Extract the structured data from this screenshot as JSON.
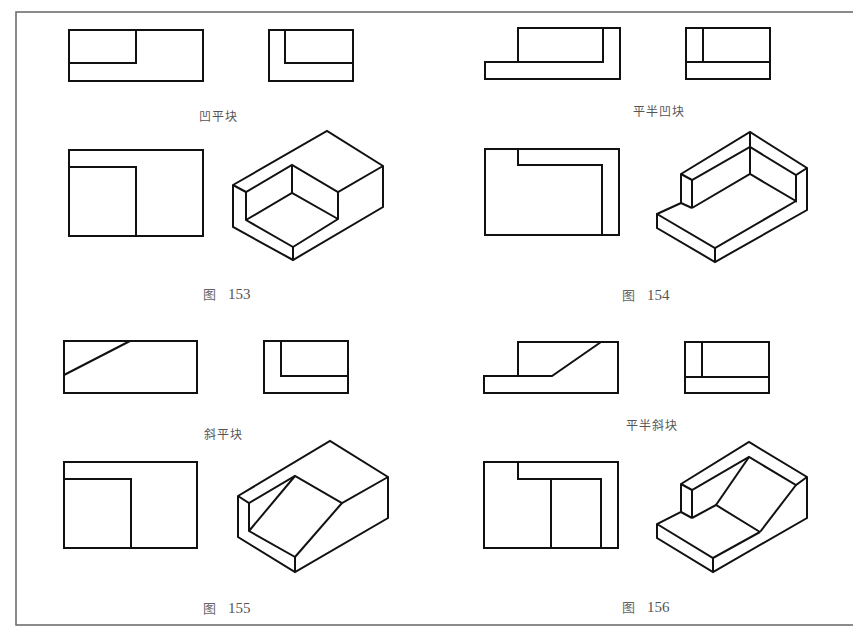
{
  "page": {
    "frame_color": "#666666",
    "line_color": "#111111"
  },
  "figures": [
    {
      "id": "153",
      "figure_prefix": "图",
      "number": "153",
      "caption": "凹平块"
    },
    {
      "id": "154",
      "figure_prefix": "图",
      "number": "154",
      "caption": "平半凹块"
    },
    {
      "id": "155",
      "figure_prefix": "图",
      "number": "155",
      "caption": "斜平块"
    },
    {
      "id": "156",
      "figure_prefix": "图",
      "number": "156",
      "caption": "平半斜块"
    }
  ]
}
